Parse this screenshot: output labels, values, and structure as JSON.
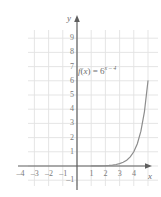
{
  "chart_data": {
    "type": "line",
    "title": "",
    "xlabel": "x",
    "ylabel": "y",
    "grid": true,
    "legend": "none",
    "xlim": [
      -5,
      5.6
    ],
    "ylim": [
      -1.6,
      10.2
    ],
    "xticks": [
      -4,
      -3,
      -2,
      -1,
      1,
      2,
      3,
      4
    ],
    "xtick_labels": [
      "–4",
      "–3",
      "–2",
      "–1",
      "1",
      "2",
      "3",
      "4"
    ],
    "yticks": [
      -1,
      1,
      2,
      3,
      4,
      5,
      6,
      7,
      8,
      9
    ],
    "ytick_labels": [
      "–1",
      "1",
      "2",
      "3",
      "4",
      "5",
      "6",
      "7",
      "8",
      "9"
    ],
    "series": [
      {
        "name": "f(x) = 6^(x-4)",
        "equation_parts": {
          "fn": "f",
          "var": "x",
          "eq": "=",
          "base": "6",
          "exponent": "x – 4"
        },
        "label_text": "f(x) = 6",
        "label_exponent": "x – 4",
        "color": "#8d8d8d",
        "x": [
          1.0,
          1.5,
          2.0,
          2.25,
          2.5,
          2.75,
          3.0,
          3.25,
          3.5,
          3.75,
          4.0,
          4.25,
          4.5,
          4.75,
          5.0
        ],
        "y": [
          0.0046,
          0.0113,
          0.0278,
          0.0435,
          0.068,
          0.1066,
          0.1667,
          0.2609,
          0.4082,
          0.6389,
          1.0,
          1.5651,
          2.4495,
          3.8336,
          6.0
        ]
      }
    ],
    "annotations": [
      {
        "name": "function-label",
        "text": "f(x) = 6^{x–4}",
        "x": 1.6,
        "y": 6.4
      }
    ]
  },
  "axes": {
    "x_axis_name": "x",
    "y_axis_name": "y",
    "arrow_x": "right",
    "arrow_y": "up",
    "axis_color": "#5e5e5e",
    "grid_color": "#e2e2e2"
  }
}
